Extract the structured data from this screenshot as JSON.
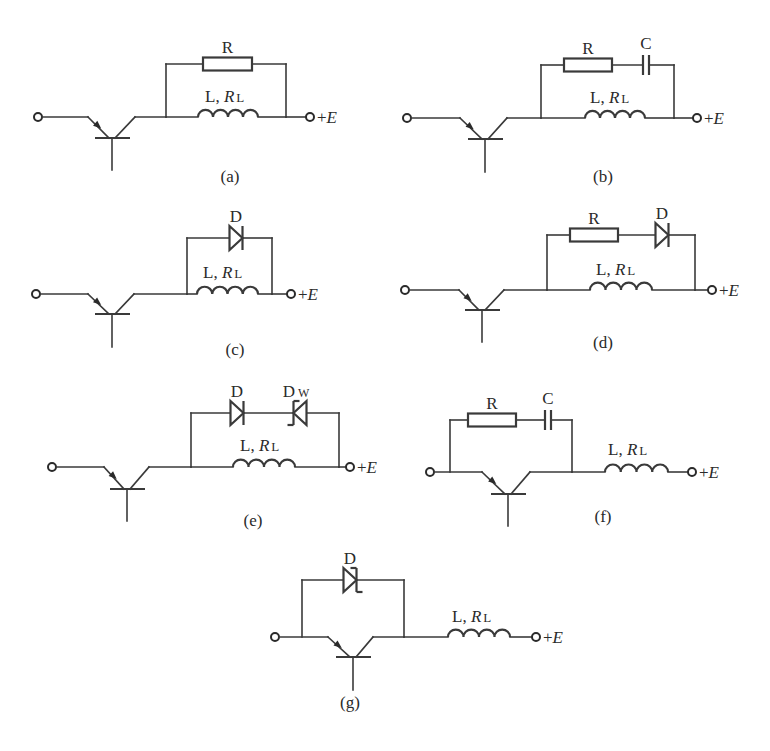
{
  "figure": {
    "background": "#ffffff",
    "ink": "#3a3a3a",
    "supply_label": "+E",
    "inductor_label": "L, R",
    "inductor_subscript": "L",
    "circuits": [
      {
        "id": "a",
        "caption": "(a)",
        "caption_pos": [
          230,
          182
        ],
        "wire_y": 117,
        "input_terminal": [
          38,
          117
        ],
        "transistor": {
          "emitter_turn_x": 88,
          "center_x": 112,
          "collector_turn_x": 135,
          "bar_y": 138,
          "stem_end_y": 170
        },
        "left_node_x": 166,
        "right_node_x": 286,
        "output_terminal": [
          310,
          117
        ],
        "branch_y": 64,
        "branch_components": [
          {
            "type": "resistor",
            "label": "R",
            "x1": 203,
            "x2": 252
          }
        ],
        "inductor": {
          "x1": 198,
          "x2": 258
        },
        "inductor_label_pos": [
          205,
          102
        ]
      },
      {
        "id": "b",
        "caption": "(b)",
        "caption_pos": [
          603,
          182
        ],
        "wire_y": 118,
        "input_terminal": [
          407,
          118
        ],
        "transistor": {
          "emitter_turn_x": 460,
          "center_x": 485,
          "collector_turn_x": 507,
          "bar_y": 139,
          "stem_end_y": 172
        },
        "left_node_x": 541,
        "right_node_x": 674,
        "output_terminal": [
          697,
          118
        ],
        "branch_y": 65,
        "branch_components": [
          {
            "type": "resistor",
            "label": "R",
            "x1": 564,
            "x2": 612
          },
          {
            "type": "capacitor",
            "label": "C",
            "x": 646
          }
        ],
        "inductor": {
          "x1": 585,
          "x2": 645
        },
        "inductor_label_pos": [
          590,
          103
        ]
      },
      {
        "id": "c",
        "caption": "(c)",
        "caption_pos": [
          235,
          355
        ],
        "wire_y": 294,
        "input_terminal": [
          36,
          294
        ],
        "transistor": {
          "emitter_turn_x": 88,
          "center_x": 112,
          "collector_turn_x": 134,
          "bar_y": 314,
          "stem_end_y": 347
        },
        "left_node_x": 187,
        "right_node_x": 272,
        "output_terminal": [
          291,
          294
        ],
        "branch_y": 238,
        "branch_components": [
          {
            "type": "diode",
            "label": "D",
            "x": 236,
            "direction": "right"
          }
        ],
        "inductor": {
          "x1": 197,
          "x2": 258
        },
        "inductor_label_pos": [
          203,
          278
        ]
      },
      {
        "id": "d",
        "caption": "(d)",
        "caption_pos": [
          603,
          348
        ],
        "wire_y": 290,
        "input_terminal": [
          405,
          290
        ],
        "transistor": {
          "emitter_turn_x": 459,
          "center_x": 482,
          "collector_turn_x": 504,
          "bar_y": 310,
          "stem_end_y": 342
        },
        "left_node_x": 547,
        "right_node_x": 695,
        "output_terminal": [
          712,
          290
        ],
        "branch_y": 235,
        "branch_components": [
          {
            "type": "resistor",
            "label": "R",
            "x1": 570,
            "x2": 618
          },
          {
            "type": "diode",
            "label": "D",
            "x": 662,
            "direction": "right"
          }
        ],
        "inductor": {
          "x1": 590,
          "x2": 652
        },
        "inductor_label_pos": [
          596,
          275
        ]
      },
      {
        "id": "e",
        "caption": "(e)",
        "caption_pos": [
          253,
          526
        ],
        "wire_y": 467,
        "input_terminal": [
          52,
          467
        ],
        "transistor": {
          "emitter_turn_x": 104,
          "center_x": 127,
          "collector_turn_x": 149,
          "bar_y": 489,
          "stem_end_y": 521
        },
        "left_node_x": 191,
        "right_node_x": 339,
        "output_terminal": [
          350,
          467
        ],
        "branch_y": 413,
        "branch_components": [
          {
            "type": "diode",
            "label": "D",
            "x": 237,
            "direction": "right"
          },
          {
            "type": "zener",
            "label": "D",
            "label_sub": "W",
            "x": 300,
            "direction": "left"
          }
        ],
        "inductor": {
          "x1": 233,
          "x2": 295
        },
        "inductor_label_pos": [
          240,
          451
        ]
      },
      {
        "id": "f",
        "caption": "(f)",
        "caption_pos": [
          603,
          522
        ],
        "wire_y": 472,
        "input_terminal": [
          430,
          472
        ],
        "transistor": {
          "emitter_turn_x": 482,
          "center_x": 508,
          "collector_turn_x": 530,
          "bar_y": 494,
          "stem_end_y": 526
        },
        "left_node_x": 450,
        "right_node_x": 572,
        "output_terminal": [
          692,
          472
        ],
        "branch_y": 420,
        "branch_components": [
          {
            "type": "resistor",
            "label": "R",
            "x1": 468,
            "x2": 516
          },
          {
            "type": "capacitor",
            "label": "C",
            "x": 548
          }
        ],
        "inductor": {
          "x1": 605,
          "x2": 668
        },
        "inductor_label_pos": [
          608,
          455
        ]
      },
      {
        "id": "g",
        "caption": "(g)",
        "caption_pos": [
          350,
          708
        ],
        "wire_y": 637,
        "input_terminal": [
          275,
          637
        ],
        "transistor": {
          "emitter_turn_x": 328,
          "center_x": 353,
          "collector_turn_x": 373,
          "bar_y": 657,
          "stem_end_y": 690
        },
        "left_node_x": 302,
        "right_node_x": 404,
        "output_terminal": [
          536,
          637
        ],
        "branch_y": 580,
        "branch_components": [
          {
            "type": "zener",
            "label": "D",
            "x": 350,
            "direction": "right"
          }
        ],
        "inductor": {
          "x1": 448,
          "x2": 510
        },
        "inductor_label_pos": [
          452,
          622
        ]
      }
    ]
  }
}
